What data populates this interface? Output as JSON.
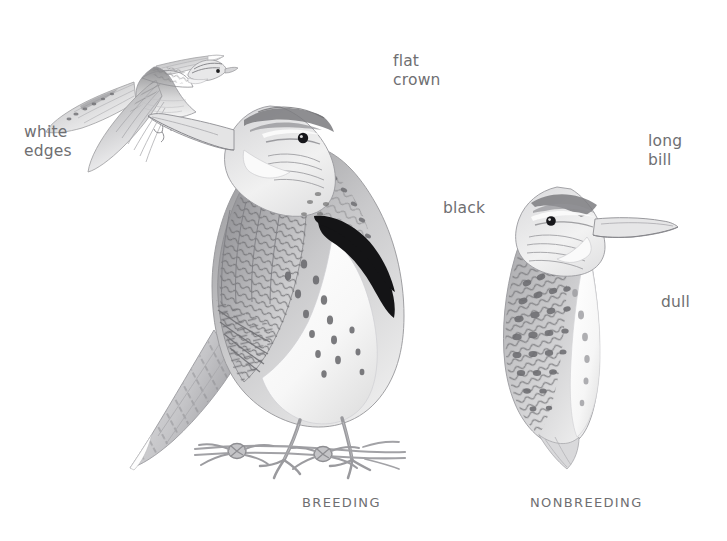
{
  "plate": {
    "subject": "meadowlark",
    "background_color": "#ffffff",
    "ink_color": "#6f6f72",
    "black_color": "#111111"
  },
  "annotations": [
    {
      "name": "white-edges",
      "text": "white\nedges",
      "x": 24,
      "y": 123
    },
    {
      "name": "flat-crown",
      "text": "flat\ncrown",
      "x": 393,
      "y": 52
    },
    {
      "name": "black",
      "text": "black",
      "x": 443,
      "y": 199
    },
    {
      "name": "long-bill",
      "text": "long\nbill",
      "x": 648,
      "y": 132
    },
    {
      "name": "dull",
      "text": "dull",
      "x": 661,
      "y": 293
    }
  ],
  "captions": [
    {
      "name": "breeding",
      "text": "BREEDING",
      "x": 302,
      "y": 495
    },
    {
      "name": "nonbreeding",
      "text": "NONBREEDING",
      "x": 530,
      "y": 495
    }
  ],
  "figures": [
    {
      "name": "flying-meadowlark",
      "view": "flight",
      "x": 38,
      "y": 22,
      "w": 195,
      "h": 155
    },
    {
      "name": "breeding-meadowlark",
      "view": "perched-breeding",
      "x": 118,
      "y": 68,
      "w": 320,
      "h": 410
    },
    {
      "name": "nonbreeding-meadowlark",
      "view": "perched-nonbreeding",
      "x": 483,
      "y": 165,
      "w": 185,
      "h": 305
    },
    {
      "name": "barbed-wire-perch",
      "view": "perch",
      "x": 195,
      "y": 425,
      "w": 200,
      "h": 45
    }
  ]
}
